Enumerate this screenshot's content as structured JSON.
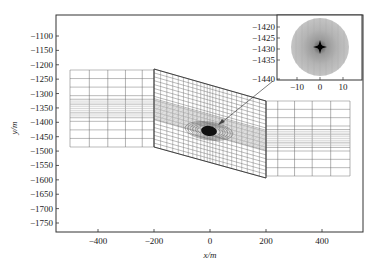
{
  "chart_data": {
    "type": "diagram-mesh",
    "title": "",
    "xlabel": "x/m",
    "ylabel": "y/m",
    "xlim": [
      -550,
      550
    ],
    "ylim": [
      -1790,
      -1025
    ],
    "xticks": [
      -400,
      -200,
      0,
      200,
      400
    ],
    "xtick_labels": [
      "−400",
      "−200",
      "0",
      "200",
      "400"
    ],
    "yticks": [
      -1100,
      -1150,
      -1200,
      -1250,
      -1300,
      -1350,
      -1400,
      -1450,
      -1500,
      -1550,
      -1600,
      -1650,
      -1700,
      -1750
    ],
    "ytick_labels": [
      "−1100",
      "−1150",
      "−1200",
      "−1250",
      "−1300",
      "−1350",
      "−1400",
      "−1450",
      "−1500",
      "−1550",
      "−1600",
      "−1650",
      "−1700",
      "−1750"
    ],
    "grid": false,
    "mesh_regions": [
      {
        "name": "left block",
        "x_range": [
          -500,
          -200
        ],
        "y_range": [
          -1485,
          -1215
        ]
      },
      {
        "name": "middle fault zone (inclined)",
        "x_range": [
          -200,
          200
        ],
        "top_edge_y": [
          -1215,
          -1325
        ],
        "bottom_edge_y": [
          -1485,
          -1600
        ]
      },
      {
        "name": "right block",
        "x_range": [
          200,
          500
        ],
        "y_range": [
          -1590,
          -1330
        ]
      }
    ],
    "refined_center": {
      "x": 0,
      "y": -1430,
      "label": "refined mesh around wellbore"
    },
    "inset": {
      "xticks": [
        -10,
        0,
        10
      ],
      "xtick_labels": [
        "−10",
        "0",
        "10"
      ],
      "yticks": [
        -1420,
        -1425,
        -1430,
        -1435,
        -1440
      ],
      "ytick_labels": [
        "−1420",
        "−1425",
        "−1430",
        "−1435",
        "−1440"
      ],
      "description": "zoomed circular refined mesh centered at (0, -1427)"
    }
  },
  "axes": {
    "xlabel": "x/m",
    "ylabel": "y/m"
  },
  "inset": {
    "yticks": [
      "−1420",
      "−1425",
      "−1430",
      "−1435",
      "−1440"
    ],
    "xticks": [
      "−10",
      "0",
      "10"
    ]
  },
  "colors": {
    "axis": "#333333",
    "mesh": "#555555",
    "mesh_dense": "#9a9a9a",
    "blob": "#111111",
    "inset_disc": "#b8b8b8"
  }
}
